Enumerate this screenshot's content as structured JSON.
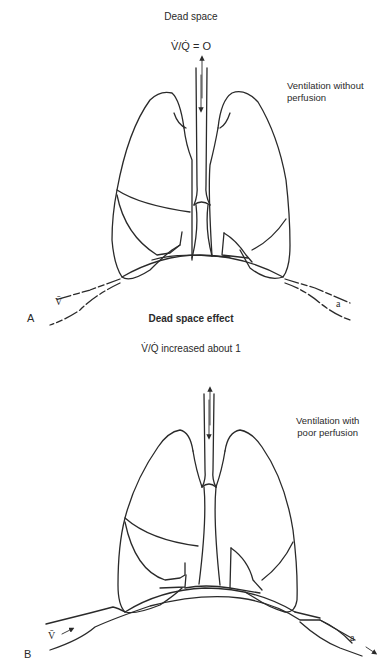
{
  "panel_a": {
    "label": "A",
    "title": "Dead space",
    "ratio": "V̇/Q̇ = O",
    "note_line1": "Ventilation without",
    "note_line2": "perfusion",
    "venous_label": "V̄",
    "arterial_label": "a"
  },
  "panel_b": {
    "label": "B",
    "title": "Dead space effect",
    "ratio": "V̇/Q̇  increased about 1",
    "note_line1": "Ventilation with",
    "note_line2": "poor perfusion",
    "venous_label": "V̄",
    "arterial_label": "a"
  }
}
